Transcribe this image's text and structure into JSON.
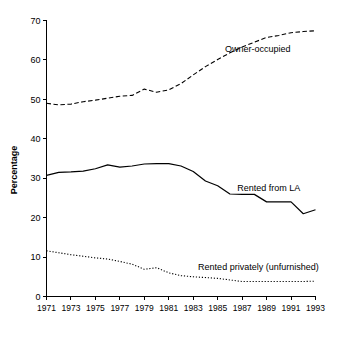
{
  "chart_data": {
    "type": "line",
    "title": "",
    "xlabel": "",
    "ylabel": "Percentage",
    "xlim": [
      1971,
      1993
    ],
    "ylim": [
      0,
      70
    ],
    "ytick_step": 10,
    "xtick_step": 2,
    "grid": false,
    "legend_position": "inline-annotations",
    "yticks": [
      "0",
      "10",
      "20",
      "30",
      "40",
      "50",
      "60",
      "70"
    ],
    "x": [
      1971,
      1972,
      1973,
      1974,
      1975,
      1976,
      1977,
      1978,
      1979,
      1980,
      1981,
      1982,
      1983,
      1984,
      1985,
      1986,
      1987,
      1988,
      1989,
      1990,
      1991,
      1992,
      1993
    ],
    "xticks": [
      "1971",
      "1973",
      "1975",
      "1977",
      "1979",
      "1981",
      "1983",
      "1985",
      "1987",
      "1989",
      "1991",
      "1993"
    ],
    "series": [
      {
        "name": "Owner-occupied",
        "style": "dashed",
        "color": "#000000",
        "label_x": 1985.6,
        "label_y": 62.0,
        "values": [
          49.0,
          48.6,
          48.8,
          49.4,
          49.8,
          50.3,
          50.8,
          51.0,
          52.6,
          51.8,
          52.4,
          54.0,
          56.2,
          58.3,
          60.1,
          61.8,
          63.3,
          64.5,
          65.7,
          66.2,
          66.9,
          67.2,
          67.4
        ]
      },
      {
        "name": "Rented from LA",
        "style": "solid",
        "color": "#000000",
        "label_x": 1986.6,
        "label_y": 26.8,
        "values": [
          30.7,
          31.5,
          31.6,
          31.8,
          32.4,
          33.4,
          32.8,
          33.1,
          33.6,
          33.7,
          33.7,
          33.1,
          31.7,
          29.3,
          28.1,
          26.0,
          25.9,
          25.9,
          24.0,
          24.0,
          24.0,
          21.0,
          22.0
        ]
      },
      {
        "name": "Rented privately (unfurnished)",
        "style": "dotted",
        "color": "#000000",
        "label_x": 1983.4,
        "label_y": 6.6,
        "values": [
          11.6,
          11.1,
          10.6,
          10.2,
          9.8,
          9.5,
          8.9,
          8.2,
          6.9,
          7.3,
          6.0,
          5.3,
          5.0,
          4.8,
          4.6,
          4.2,
          3.8,
          3.8,
          3.8,
          3.8,
          3.8,
          3.8,
          3.9
        ]
      }
    ]
  }
}
